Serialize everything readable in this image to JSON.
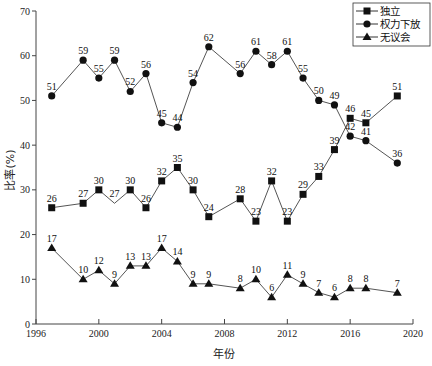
{
  "chart_data": {
    "type": "line",
    "title": "",
    "xlabel": "年份",
    "ylabel": "比率(%)",
    "xlim": [
      1996,
      2020
    ],
    "ylim": [
      0,
      70
    ],
    "x_ticks": [
      1996,
      2000,
      2004,
      2008,
      2012,
      2016,
      2020
    ],
    "y_ticks": [
      0,
      10,
      20,
      30,
      40,
      50,
      60,
      70
    ],
    "grid": false,
    "legend_position": "top-right",
    "series": [
      {
        "name": "独立",
        "marker": "square",
        "points": [
          {
            "x": 1997,
            "y": 26
          },
          {
            "x": 1999,
            "y": 27
          },
          {
            "x": 2000,
            "y": 30
          },
          {
            "x": 2001,
            "y": 27,
            "no_marker": true
          },
          {
            "x": 2002,
            "y": 30
          },
          {
            "x": 2003,
            "y": 26
          },
          {
            "x": 2004,
            "y": 32
          },
          {
            "x": 2005,
            "y": 35
          },
          {
            "x": 2006,
            "y": 30
          },
          {
            "x": 2007,
            "y": 24
          },
          {
            "x": 2009,
            "y": 28
          },
          {
            "x": 2010,
            "y": 23
          },
          {
            "x": 2011,
            "y": 32
          },
          {
            "x": 2012,
            "y": 23
          },
          {
            "x": 2013,
            "y": 29
          },
          {
            "x": 2014,
            "y": 33
          },
          {
            "x": 2015,
            "y": 39
          },
          {
            "x": 2016,
            "y": 46
          },
          {
            "x": 2017,
            "y": 45
          },
          {
            "x": 2019,
            "y": 51
          }
        ]
      },
      {
        "name": "权力下放",
        "marker": "circle",
        "points": [
          {
            "x": 1997,
            "y": 51
          },
          {
            "x": 1999,
            "y": 59
          },
          {
            "x": 2000,
            "y": 55
          },
          {
            "x": 2001,
            "y": 59
          },
          {
            "x": 2002,
            "y": 52
          },
          {
            "x": 2003,
            "y": 56
          },
          {
            "x": 2004,
            "y": 45
          },
          {
            "x": 2005,
            "y": 44
          },
          {
            "x": 2006,
            "y": 54
          },
          {
            "x": 2007,
            "y": 62
          },
          {
            "x": 2009,
            "y": 56
          },
          {
            "x": 2010,
            "y": 61
          },
          {
            "x": 2011,
            "y": 58
          },
          {
            "x": 2012,
            "y": 61
          },
          {
            "x": 2013,
            "y": 55
          },
          {
            "x": 2014,
            "y": 50
          },
          {
            "x": 2015,
            "y": 49
          },
          {
            "x": 2016,
            "y": 42
          },
          {
            "x": 2017,
            "y": 41
          },
          {
            "x": 2019,
            "y": 36
          }
        ]
      },
      {
        "name": "无议会",
        "marker": "triangle",
        "points": [
          {
            "x": 1997,
            "y": 17
          },
          {
            "x": 1999,
            "y": 10
          },
          {
            "x": 2000,
            "y": 12
          },
          {
            "x": 2001,
            "y": 9
          },
          {
            "x": 2002,
            "y": 13
          },
          {
            "x": 2003,
            "y": 13
          },
          {
            "x": 2004,
            "y": 17
          },
          {
            "x": 2005,
            "y": 14
          },
          {
            "x": 2006,
            "y": 9
          },
          {
            "x": 2007,
            "y": 9
          },
          {
            "x": 2009,
            "y": 8
          },
          {
            "x": 2010,
            "y": 10
          },
          {
            "x": 2011,
            "y": 6
          },
          {
            "x": 2012,
            "y": 11
          },
          {
            "x": 2013,
            "y": 9
          },
          {
            "x": 2014,
            "y": 7
          },
          {
            "x": 2015,
            "y": 6
          },
          {
            "x": 2016,
            "y": 8
          },
          {
            "x": 2017,
            "y": 8
          },
          {
            "x": 2019,
            "y": 7
          }
        ]
      }
    ]
  },
  "colors": {
    "line": "#555555",
    "marker": "#111111",
    "axis": "#444444"
  },
  "labels": {
    "xlabel": "年份",
    "ylabel": "比率(%)",
    "legend": [
      "独立",
      "权力下放",
      "无议会"
    ]
  }
}
